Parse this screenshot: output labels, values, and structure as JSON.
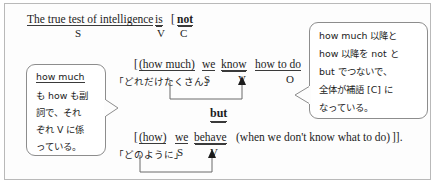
{
  "document": {
    "type": "english-grammar-sentence-analysis",
    "language_mix": "english-japanese",
    "border_color": "#b9b9b9",
    "text_color": "#1c1c1c"
  },
  "main_clause": {
    "line1": {
      "subject": "The true test of intelligence",
      "verb": "is",
      "bracket_open": "[",
      "complement": "not",
      "labels": {
        "s": "S",
        "v": "V",
        "c": "C"
      }
    }
  },
  "clause_a": {
    "bracket_open": "[",
    "adverbial": "(how much)",
    "subject": "we",
    "verb": "know",
    "object": "how to do",
    "bracket_close": "],",
    "gloss": "「どれだけたくさん」",
    "labels": {
      "s": "S",
      "v": "V",
      "o": "O"
    }
  },
  "conjunction": {
    "text": "but"
  },
  "clause_b": {
    "bracket_open": "[",
    "adverbial": "(how)",
    "subject": "we",
    "verb": "behave",
    "subordinate": "(when we don't know what to do)",
    "bracket_close": "]].",
    "gloss": "「どのように」",
    "labels": {
      "s": "S",
      "v": "V"
    }
  },
  "callout_left": {
    "lines": [
      {
        "underlined": "how much",
        "plain": ""
      },
      {
        "underlined": "",
        "plain": "も ",
        "underlined2": "how",
        "plain2": " も副"
      },
      {
        "plain": "詞で、それ"
      },
      {
        "plain": "ぞれ V に係"
      },
      {
        "plain": "っている。"
      }
    ],
    "line_texts": [
      "how much",
      "も how も副",
      "詞で、それ",
      "ぞれ V に係",
      "っている。"
    ]
  },
  "callout_right": {
    "line_texts": [
      "how much 以降と",
      "how 以降を not と",
      "but でつないで、",
      "全体が補語 [C] に",
      "なっている。"
    ]
  }
}
